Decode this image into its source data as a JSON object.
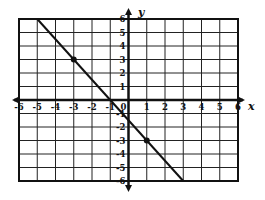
{
  "chart_data": {
    "type": "line",
    "title": "",
    "xlabel": "x",
    "ylabel": "y",
    "xlim": [
      -6,
      6
    ],
    "ylim": [
      -6,
      6
    ],
    "grid": true,
    "x_ticks": [
      -6,
      -5,
      -4,
      -3,
      -2,
      -1,
      0,
      1,
      2,
      3,
      4,
      5,
      6
    ],
    "y_ticks": [
      -6,
      -5,
      -4,
      -3,
      -2,
      -1,
      1,
      2,
      3,
      4,
      5,
      6
    ],
    "series": [
      {
        "name": "line",
        "equation": "y = -1.5x - 1.5",
        "x": [
          -5,
          3
        ],
        "y": [
          6,
          -6
        ]
      }
    ],
    "points": [
      {
        "x": -3,
        "y": 3
      },
      {
        "x": 1,
        "y": -3
      }
    ],
    "colors": {
      "ink": "#111111",
      "grid": "#222222",
      "background": "#ffffff"
    }
  }
}
